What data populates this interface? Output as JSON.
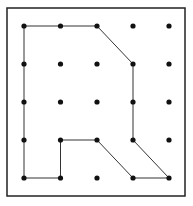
{
  "diagram": {
    "type": "geoboard-polygon",
    "grid": {
      "cols": 5,
      "rows": 5,
      "x": [
        24,
        60.5,
        97,
        133,
        169
      ],
      "y": [
        26,
        64,
        102,
        140,
        178
      ],
      "dot_color": "#111111"
    },
    "border": {
      "x": 7,
      "y": 8,
      "width": 178,
      "height": 188,
      "color": "#222222"
    },
    "polygon": {
      "stroke": "#333333",
      "vertices": [
        [
          0,
          0
        ],
        [
          2,
          0
        ],
        [
          3,
          1
        ],
        [
          3,
          3
        ],
        [
          4,
          4
        ],
        [
          3,
          4
        ],
        [
          2,
          3
        ],
        [
          1,
          3
        ],
        [
          1,
          4
        ],
        [
          0,
          4
        ]
      ]
    }
  }
}
